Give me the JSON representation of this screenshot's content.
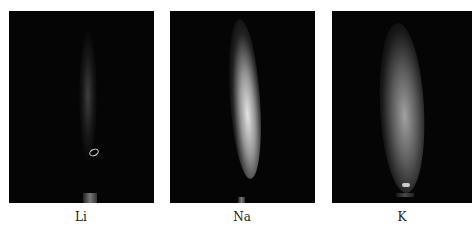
{
  "figure": {
    "panels": [
      {
        "id": "li",
        "label": "Li",
        "flame_color": "#4a4a4a"
      },
      {
        "id": "na",
        "label": "Na",
        "flame_color": "#d8d8d8"
      },
      {
        "id": "k",
        "label": "K",
        "flame_color": "#9a9a9a"
      }
    ],
    "background_color": "#050505"
  }
}
